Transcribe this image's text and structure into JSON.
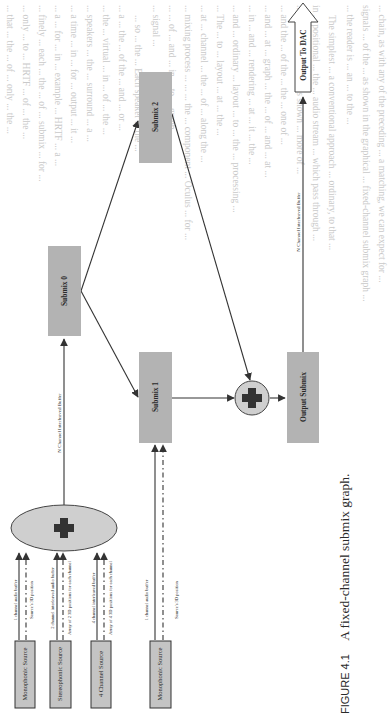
{
  "figure": {
    "number_label": "FIGURE 4.1",
    "caption": "A fixed-channel submix graph.",
    "nodes": {
      "output_dac": "Output To DAC",
      "submix_2": "Submix 2",
      "submix_0": "Submix 0",
      "submix_1": "Submix 1",
      "output_submix": "Output Submix"
    },
    "edges": {
      "n_channel_buffer_output": "N Channel Interleaved Buffer",
      "n_channel_buffer_submix0": "N Channel Interleaved Buffer"
    },
    "sources": [
      {
        "label": "Monophonic Source",
        "audio_label": "1 channel audio buffer",
        "position_label": "Source's 3D position"
      },
      {
        "label": "Stereophonic Source",
        "audio_label": "2 channel interleaved audio buffer",
        "position_label": "Array of 2 3D positions for each channel"
      },
      {
        "label": "4 Channel Source",
        "audio_label": "4 channel interleaved buffer",
        "position_label": "Array of 4 3D positions for each channel"
      },
      {
        "label": "Monophonic Source",
        "audio_label": "1 channel audio buffer",
        "position_label": "Source's 3D position"
      }
    ],
    "colors": {
      "node_fill": "#b3b3b3",
      "source_fill": "#c4c4c4",
      "mixer_fill": "#cfcfcf",
      "plus_glyph": "#333333",
      "line": "#333333"
    }
  },
  "bleed_through": {
    "lines": [
      "... chain, as with any of the preceding ... a matching, we can expect for ...",
      "signals ... of the ... as shown in the graphical ... fixed-channel submix graph ...",
      "... the reader is ... an ... to the ...",
      "The simplest ... a conventional approach ... ordinary, to that ...",
      "in ... positional ... the ... audio stream ... which pass through ...",
      "... cap ... This ... of ... as shown ... more of ...",
      "... and the ... of the ... the ... one of ...",
      "... and ... at ... graph ... the ... of ... and ... at ...",
      "... in ... and ... rendering ... at ... it ... the ...",
      "... and ... ordinary ... layout ... to ... the ... processing ...",
      "... The ... to ... layout ... at ... the ...",
      "... at ... channel ... the ... of ... along the ...",
      "... mixing process ... ... ... the ... component ... Oculus ... for ...",
      "... ... of ... and ... in ... to ... graph ...",
      "... signal ...",
      "... so ... the ... Each speaker ... the ...",
      "... a ... the ... of the ... and ... or ...",
      "... the ... virtual ... in ... of ... the ...",
      "... speakers ... the ... surround ... a ...",
      "... a time ... in ... for ... output ... it ...",
      "... a ... for ... in ... example ... HRTF ... a ...",
      "... finely ... each ... the ... of ... submix ... for ...",
      "... only ... to ... HRTF ... of ... the ...",
      "... that ... the ... of ... only ... the ...",
      "... realize the speakers. ... what ... the ...",
      "HRTF ... spatialization ... outside ... the ... for ...",
      "HRTF ... sound ... to ... to ... device ...",
      "Building ... the engine ... with ... the ...",
      "... configuration ... the ... audio ... the ...",
      "... audio ... of ... the ...",
      "... important ... as ...",
      "1. ... channel ... the ... and ...",
      "2. ... multichannel ... for ... to ... the ...",
      "3. ... submix ... of ... the ...",
      "Using ... the ... one ... and ... for ... the ...",
      "... input ... submix ... the ... for ... routing ..."
    ]
  }
}
